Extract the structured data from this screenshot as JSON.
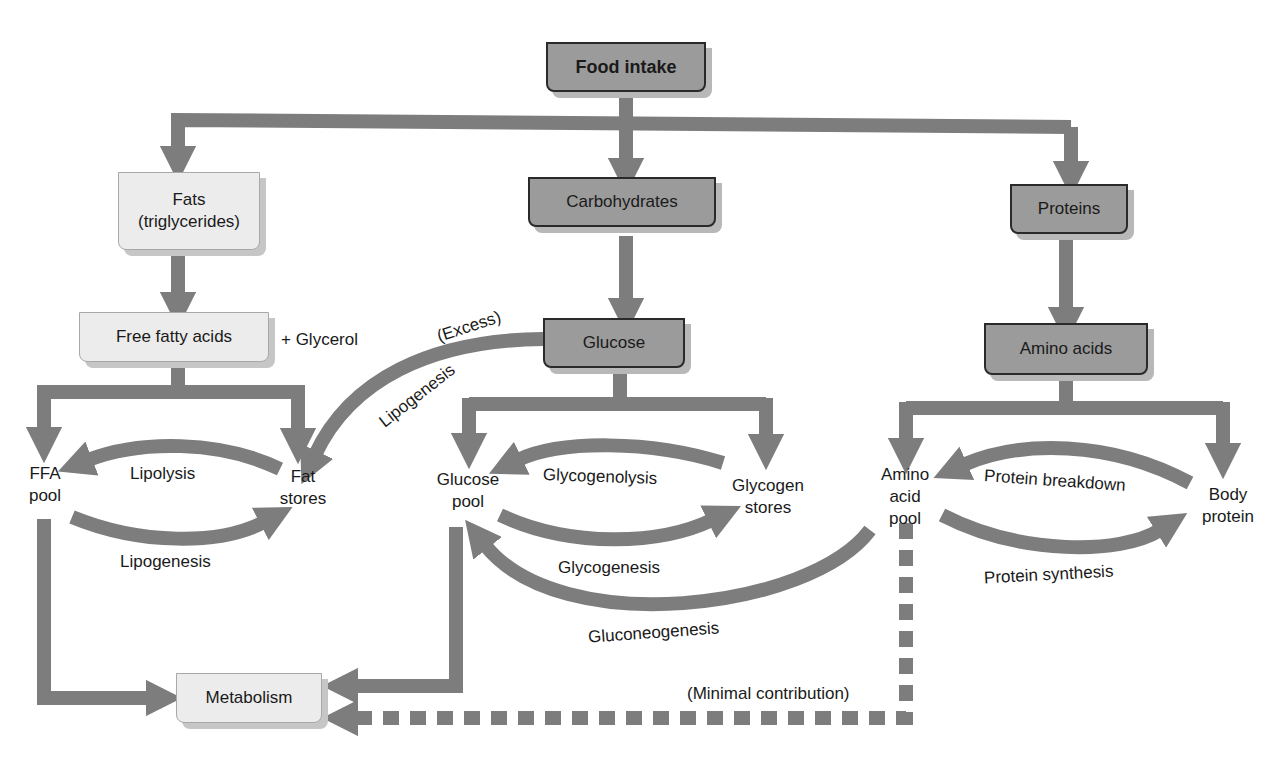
{
  "diagram": {
    "colors": {
      "arrow": "#7d7d7d",
      "dark_box_fill": "#9b9b9b",
      "light_box_fill": "#ececec",
      "text": "#1a1a1a",
      "background": "#ffffff"
    },
    "nodes": {
      "food_intake": "Food intake",
      "fats_line1": "Fats",
      "fats_line2": "(triglycerides)",
      "carbohydrates": "Carbohydrates",
      "proteins": "Proteins",
      "free_fatty_acids": "Free fatty acids",
      "glucose": "Glucose",
      "amino_acids": "Amino acids",
      "metabolism": "Metabolism"
    },
    "pools": {
      "ffa_pool_line1": "FFA",
      "ffa_pool_line2": "pool",
      "fat_stores_line1": "Fat",
      "fat_stores_line2": "stores",
      "glucose_pool_line1": "Glucose",
      "glucose_pool_line2": "pool",
      "glycogen_stores_line1": "Glycogen",
      "glycogen_stores_line2": "stores",
      "amino_pool_line1": "Amino",
      "amino_pool_line2": "acid",
      "amino_pool_line3": "pool",
      "body_protein_line1": "Body",
      "body_protein_line2": "protein"
    },
    "process_labels": {
      "glycerol": "+ Glycerol",
      "excess": "(Excess)",
      "lipogenesis_from_glucose": "Lipogenesis",
      "lipolysis": "Lipolysis",
      "lipogenesis": "Lipogenesis",
      "glycogenolysis": "Glycogenolysis",
      "glycogenesis": "Glycogenesis",
      "gluconeogenesis": "Gluconeogenesis",
      "protein_breakdown": "Protein breakdown",
      "protein_synthesis": "Protein synthesis",
      "minimal_contribution": "(Minimal contribution)"
    },
    "edges": [
      {
        "from": "Food intake",
        "to": "Fats (triglycerides)"
      },
      {
        "from": "Food intake",
        "to": "Carbohydrates"
      },
      {
        "from": "Food intake",
        "to": "Proteins"
      },
      {
        "from": "Fats (triglycerides)",
        "to": "Free fatty acids"
      },
      {
        "from": "Carbohydrates",
        "to": "Glucose"
      },
      {
        "from": "Proteins",
        "to": "Amino acids"
      },
      {
        "from": "Free fatty acids",
        "to": "FFA pool"
      },
      {
        "from": "Free fatty acids",
        "to": "Fat stores"
      },
      {
        "from": "Glucose",
        "to": "Glucose pool"
      },
      {
        "from": "Glucose",
        "to": "Glycogen stores"
      },
      {
        "from": "Glucose",
        "to": "Fat stores",
        "label": "(Excess) Lipogenesis"
      },
      {
        "from": "Amino acids",
        "to": "Amino acid pool"
      },
      {
        "from": "Amino acids",
        "to": "Body protein"
      },
      {
        "from": "Fat stores",
        "to": "FFA pool",
        "label": "Lipolysis"
      },
      {
        "from": "FFA pool",
        "to": "Fat stores",
        "label": "Lipogenesis"
      },
      {
        "from": "Glycogen stores",
        "to": "Glucose pool",
        "label": "Glycogenolysis"
      },
      {
        "from": "Glucose pool",
        "to": "Glycogen stores",
        "label": "Glycogenesis"
      },
      {
        "from": "Amino acid pool",
        "to": "Glucose pool",
        "label": "Gluconeogenesis"
      },
      {
        "from": "Body protein",
        "to": "Amino acid pool",
        "label": "Protein breakdown"
      },
      {
        "from": "Amino acid pool",
        "to": "Body protein",
        "label": "Protein synthesis"
      },
      {
        "from": "FFA pool",
        "to": "Metabolism"
      },
      {
        "from": "Glucose pool",
        "to": "Metabolism"
      },
      {
        "from": "Amino acid pool",
        "to": "Metabolism",
        "label": "(Minimal contribution)",
        "style": "dashed"
      }
    ]
  }
}
